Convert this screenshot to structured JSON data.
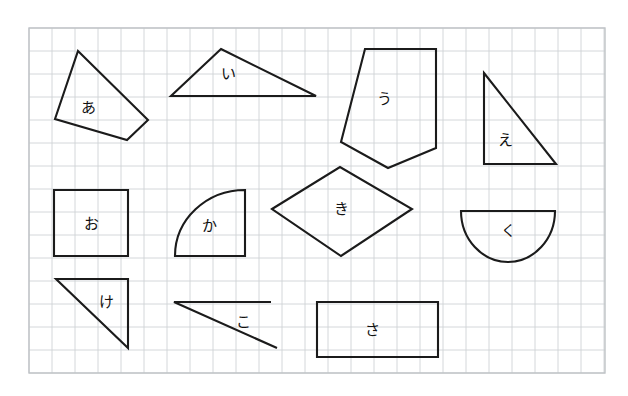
{
  "page": {
    "background_color": "#ffffff",
    "width": 628,
    "height": 396
  },
  "grid": {
    "name": "graph-paper-grid",
    "origin_x": 29,
    "origin_y": 28,
    "right": 605,
    "bottom": 373,
    "cell_size": 23,
    "line_color": "#cfd2d6",
    "border_color": "#bfc3c7",
    "columns": 25,
    "rows": 15
  },
  "ink": {
    "stroke_color": "#1b1b1b",
    "stroke_width": 2.1
  },
  "shapes": [
    {
      "id": "shape-a",
      "label": "あ",
      "kind": "quadrilateral",
      "label_x": 88,
      "label_y": 108,
      "points": "78,51 148,120 127,140 55,119"
    },
    {
      "id": "shape-i",
      "label": "い",
      "kind": "triangle",
      "label_x": 228,
      "label_y": 74,
      "points": "221,49 316,96 171,96"
    },
    {
      "id": "shape-u",
      "label": "う",
      "kind": "pentagon",
      "label_x": 384,
      "label_y": 99,
      "points": "365,49 436,49 436,148 388,168 341,142"
    },
    {
      "id": "shape-e",
      "label": "え",
      "kind": "right-triangle",
      "label_x": 505,
      "label_y": 140,
      "points": "484,73 556,164 484,164"
    },
    {
      "id": "shape-o",
      "label": "お",
      "kind": "square",
      "label_x": 91,
      "label_y": 224,
      "points": "54,190 128,190 128,256 54,256"
    },
    {
      "id": "shape-ka",
      "label": "か",
      "kind": "quarter-circle",
      "label_x": 209,
      "label_y": 226,
      "path": "M 175 256 L 245 256 L 245 190 A 70 66 0 0 0 175 256 Z"
    },
    {
      "id": "shape-ki",
      "label": "き",
      "kind": "rhombus",
      "label_x": 341,
      "label_y": 209,
      "points": "272,209 340,167 412,209 341,256"
    },
    {
      "id": "shape-ku",
      "label": "く",
      "kind": "half-circle",
      "label_x": 508,
      "label_y": 231,
      "path": "M 461 211 L 555 211 A 47 51 0 0 1 461 211 Z"
    },
    {
      "id": "shape-ke",
      "label": "け",
      "kind": "right-triangle",
      "label_x": 106,
      "label_y": 302,
      "points": "56,279 128,279 128,348"
    },
    {
      "id": "shape-ko",
      "label": "こ",
      "kind": "open-thin-triangle",
      "label_x": 243,
      "label_y": 322,
      "path": "M 271 302 L 174 302 L 277 348"
    },
    {
      "id": "shape-sa",
      "label": "さ",
      "kind": "rectangle",
      "label_x": 372,
      "label_y": 330,
      "points": "317,302 438,302 438,357 317,357"
    }
  ]
}
